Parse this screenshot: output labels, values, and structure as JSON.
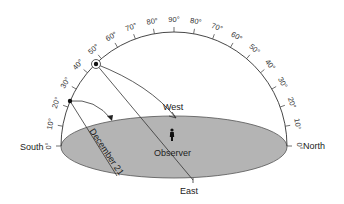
{
  "directions": {
    "south": "South",
    "north": "North",
    "east": "East",
    "west": "West"
  },
  "observer_label": "Observer",
  "path_label": "December 21",
  "altitude_scale": {
    "left": [
      "0°",
      "10°",
      "20°",
      "30°",
      "40°",
      "50°",
      "60°",
      "70°",
      "80°"
    ],
    "top": "90°",
    "right": [
      "80°",
      "70°",
      "60°",
      "50°",
      "40°",
      "30°",
      "20°",
      "10°",
      "0°"
    ]
  },
  "markers": [
    {
      "name": "noon-sun-high",
      "altitude_deg": 45,
      "style": "circled-dot"
    },
    {
      "name": "noon-sun-low",
      "altitude_deg": 23,
      "style": "dot"
    }
  ],
  "colors": {
    "ground": "#b4b4b4",
    "ground_stroke": "#555555",
    "line": "#333333",
    "background": "#ffffff"
  }
}
